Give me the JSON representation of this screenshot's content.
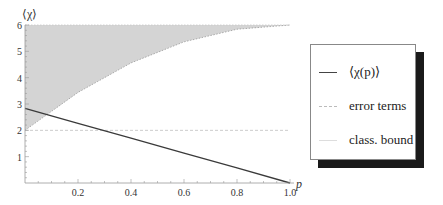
{
  "chart_data": {
    "type": "line",
    "title": "",
    "xlabel": "p",
    "ylabel": "⟨χ⟩",
    "xlim": [
      0,
      1.0
    ],
    "ylim": [
      0,
      6
    ],
    "x_ticks": [
      0.2,
      0.4,
      0.6,
      0.8,
      1.0
    ],
    "x_tick_labels": [
      "0.2",
      "0.4",
      "0.6",
      "0.8",
      "1.0"
    ],
    "y_ticks": [
      1,
      2,
      3,
      4,
      5,
      6
    ],
    "y_tick_labels": [
      "1",
      "2",
      "3",
      "4",
      "5",
      "6"
    ],
    "grid": false,
    "legend_position": "right, outside plot",
    "series": [
      {
        "name": "⟨χ(p)⟩",
        "style": "solid dark line",
        "x": [
          0,
          0.2,
          0.4,
          0.6,
          0.8,
          1.0
        ],
        "values": [
          2.83,
          2.26,
          1.7,
          1.13,
          0.57,
          0.0
        ]
      },
      {
        "name": "error terms",
        "style": "shaded gray region with dotted boundary",
        "x": [
          0,
          0.2,
          0.4,
          0.6,
          0.8,
          1.0
        ],
        "lower": [
          2.0,
          3.44,
          4.56,
          5.36,
          5.84,
          6.0
        ],
        "upper": [
          6,
          6,
          6,
          6,
          6,
          6
        ]
      },
      {
        "name": "class. bound",
        "style": "light dashed horizontal line",
        "x": [
          0,
          1.0
        ],
        "values": [
          2,
          2
        ]
      }
    ]
  },
  "legend": {
    "items": [
      {
        "label": "⟨χ(p)⟩"
      },
      {
        "label": "error terms"
      },
      {
        "label": "class. bound"
      }
    ]
  },
  "axes": {
    "xlabel": "p",
    "ylabel": "⟨χ⟩"
  }
}
